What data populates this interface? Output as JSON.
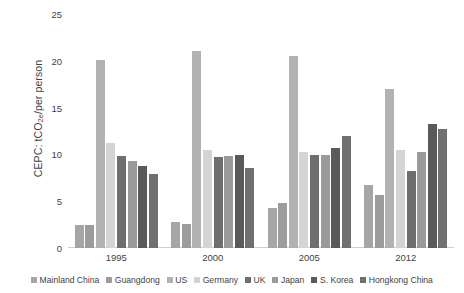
{
  "chart_data": {
    "type": "bar",
    "title": "",
    "subtitle": "",
    "xlabel": "",
    "ylabel": "CEPC: tCO2e/per person",
    "ylabel_prefix": "CEPC: tCO",
    "ylabel_sub": "2e",
    "ylabel_suffix": "/per person",
    "ylim": [
      0,
      25
    ],
    "yticks": [
      0,
      5,
      10,
      15,
      20,
      25
    ],
    "ytick_labels": [
      "0",
      "5",
      "10",
      "15",
      "20",
      "25"
    ],
    "grid": false,
    "legend_position": "bottom",
    "categories": [
      "1995",
      "2000",
      "2005",
      "2012"
    ],
    "series": [
      {
        "name": "Mainland China",
        "color": "#a6a6a6",
        "values": [
          2.5,
          2.8,
          4.3,
          6.7
        ]
      },
      {
        "name": "Guangdong",
        "color": "#9c9c9c",
        "values": [
          2.5,
          2.6,
          4.8,
          5.7
        ]
      },
      {
        "name": "US",
        "color": "#b2b2b2",
        "values": [
          20.1,
          21.0,
          20.5,
          17.0
        ]
      },
      {
        "name": "Germany",
        "color": "#d4d4d4",
        "values": [
          11.2,
          10.5,
          10.3,
          10.5
        ]
      },
      {
        "name": "UK",
        "color": "#6e6e6e",
        "values": [
          9.8,
          9.7,
          9.9,
          8.2
        ]
      },
      {
        "name": "Japan",
        "color": "#9a9a9a",
        "values": [
          9.3,
          9.8,
          9.9,
          10.3
        ]
      },
      {
        "name": "S. Korea",
        "color": "#5a5a5a",
        "values": [
          8.8,
          9.9,
          10.7,
          13.2
        ]
      },
      {
        "name": "Hongkong China",
        "color": "#707070",
        "values": [
          7.9,
          8.6,
          12.0,
          12.7
        ]
      }
    ]
  }
}
